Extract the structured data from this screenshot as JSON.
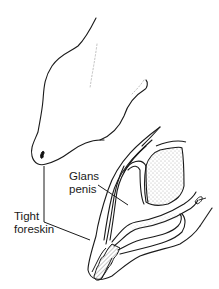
{
  "figure": {
    "type": "anatomical illustration",
    "labels": {
      "glans": {
        "line1": "Glans",
        "line2": "penis"
      },
      "foreskin": {
        "line1": "Tight",
        "line2": "foreskin"
      }
    },
    "signature": "artist signature mark",
    "colors": {
      "ink": "#1a1a1a",
      "background": "#ffffff",
      "stipple": "#555555"
    }
  }
}
